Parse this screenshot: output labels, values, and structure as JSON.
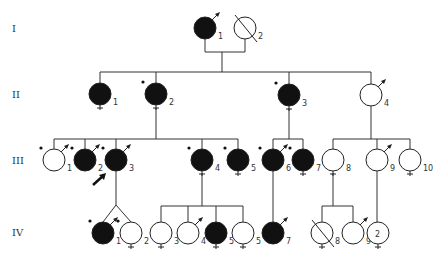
{
  "generations": [
    {
      "label": "I",
      "y": 28
    },
    {
      "label": "II",
      "y": 94
    },
    {
      "label": "III",
      "y": 160
    },
    {
      "label": "IV",
      "y": 232
    }
  ],
  "individuals": [
    {
      "id": "I-1",
      "num": "1",
      "x": 205,
      "y": 28,
      "affected": true,
      "examined": false,
      "arrow": true,
      "deceased": false,
      "cross": false
    },
    {
      "id": "I-2",
      "num": "2",
      "x": 245,
      "y": 28,
      "affected": false,
      "examined": false,
      "arrow": false,
      "deceased": true,
      "cross": false
    },
    {
      "id": "II-1",
      "num": "1",
      "x": 100,
      "y": 94,
      "affected": true,
      "examined": false,
      "arrow": false,
      "deceased": false,
      "cross": true
    },
    {
      "id": "II-2",
      "num": "2",
      "x": 156,
      "y": 94,
      "affected": true,
      "examined": true,
      "arrow": false,
      "deceased": false,
      "cross": true
    },
    {
      "id": "II-3",
      "num": "3",
      "x": 289,
      "y": 95,
      "affected": true,
      "examined": true,
      "arrow": false,
      "deceased": false,
      "cross": true
    },
    {
      "id": "II-4",
      "num": "4",
      "x": 371,
      "y": 95,
      "affected": false,
      "examined": false,
      "arrow": true,
      "deceased": false,
      "cross": false
    },
    {
      "id": "III-1",
      "num": "1",
      "x": 54,
      "y": 160,
      "affected": false,
      "examined": true,
      "arrow": true,
      "deceased": false,
      "cross": false
    },
    {
      "id": "III-2",
      "num": "2",
      "x": 85,
      "y": 160,
      "affected": true,
      "examined": true,
      "arrow": true,
      "deceased": false,
      "cross": false
    },
    {
      "id": "III-3",
      "num": "3",
      "x": 116,
      "y": 160,
      "affected": true,
      "examined": true,
      "arrow": true,
      "deceased": false,
      "cross": false,
      "proband": true
    },
    {
      "id": "III-4",
      "num": "4",
      "x": 202,
      "y": 160,
      "affected": true,
      "examined": true,
      "arrow": false,
      "deceased": false,
      "cross": true
    },
    {
      "id": "III-5",
      "num": "5",
      "x": 238,
      "y": 160,
      "affected": true,
      "examined": true,
      "arrow": false,
      "deceased": false,
      "cross": true
    },
    {
      "id": "III-6",
      "num": "6",
      "x": 273,
      "y": 160,
      "affected": true,
      "examined": true,
      "arrow": true,
      "deceased": false,
      "cross": false
    },
    {
      "id": "III-7",
      "num": "7",
      "x": 303,
      "y": 160,
      "affected": true,
      "examined": true,
      "arrow": false,
      "deceased": false,
      "cross": true
    },
    {
      "id": "III-8",
      "num": "8",
      "x": 333,
      "y": 160,
      "affected": false,
      "examined": false,
      "arrow": false,
      "deceased": false,
      "cross": true
    },
    {
      "id": "III-9",
      "num": "9",
      "x": 377,
      "y": 160,
      "affected": false,
      "examined": false,
      "arrow": true,
      "deceased": false,
      "cross": false
    },
    {
      "id": "III-10",
      "num": "10",
      "x": 410,
      "y": 160,
      "affected": false,
      "examined": false,
      "arrow": false,
      "deceased": false,
      "cross": true
    },
    {
      "id": "IV-1",
      "num": "1",
      "x": 103,
      "y": 233,
      "affected": true,
      "examined": true,
      "arrow": true,
      "deceased": false,
      "cross": false
    },
    {
      "id": "IV-2",
      "num": "2",
      "x": 131,
      "y": 233,
      "affected": false,
      "examined": true,
      "arrow": false,
      "deceased": false,
      "cross": true
    },
    {
      "id": "IV-3",
      "num": "3",
      "x": 161,
      "y": 233,
      "affected": false,
      "examined": false,
      "arrow": false,
      "deceased": false,
      "cross": true
    },
    {
      "id": "IV-4",
      "num": "4",
      "x": 188,
      "y": 233,
      "affected": false,
      "examined": false,
      "arrow": true,
      "deceased": false,
      "cross": false
    },
    {
      "id": "IV-5",
      "num": "5",
      "x": 216,
      "y": 233,
      "affected": true,
      "examined": false,
      "arrow": false,
      "deceased": false,
      "cross": true
    },
    {
      "id": "IV-6",
      "num": "5",
      "x": 243,
      "y": 233,
      "affected": false,
      "examined": false,
      "arrow": false,
      "deceased": false,
      "cross": true
    },
    {
      "id": "IV-7",
      "num": "7",
      "x": 273,
      "y": 233,
      "affected": true,
      "examined": false,
      "arrow": true,
      "deceased": false,
      "cross": false
    },
    {
      "id": "IV-8",
      "num": "8",
      "x": 322,
      "y": 233,
      "affected": false,
      "examined": false,
      "arrow": false,
      "deceased": true,
      "cross": true
    },
    {
      "id": "IV-9",
      "num": "9",
      "x": 353,
      "y": 233,
      "affected": false,
      "examined": false,
      "arrow": true,
      "deceased": false,
      "cross": false
    },
    {
      "id": "IV-10",
      "num": "",
      "inner": "2",
      "x": 378,
      "y": 233,
      "affected": false,
      "examined": false,
      "arrow": false,
      "deceased": false,
      "cross": true
    }
  ],
  "lines": [
    [
      205,
      39,
      205,
      52
    ],
    [
      245,
      39,
      245,
      52
    ],
    [
      205,
      52,
      245,
      52
    ],
    [
      222,
      52,
      222,
      72
    ],
    [
      100,
      72,
      371,
      72
    ],
    [
      100,
      72,
      100,
      83
    ],
    [
      156,
      72,
      156,
      83
    ],
    [
      289,
      72,
      289,
      84
    ],
    [
      371,
      72,
      371,
      84
    ],
    [
      156,
      108,
      156,
      139
    ],
    [
      54,
      139,
      238,
      139
    ],
    [
      54,
      139,
      54,
      149
    ],
    [
      85,
      139,
      85,
      149
    ],
    [
      116,
      139,
      116,
      149
    ],
    [
      202,
      139,
      202,
      149
    ],
    [
      238,
      139,
      238,
      149
    ],
    [
      289,
      108,
      289,
      139
    ],
    [
      273,
      139,
      303,
      139
    ],
    [
      273,
      139,
      273,
      149
    ],
    [
      303,
      139,
      303,
      149
    ],
    [
      371,
      106,
      371,
      139
    ],
    [
      333,
      139,
      410,
      139
    ],
    [
      333,
      139,
      333,
      149
    ],
    [
      377,
      139,
      377,
      149
    ],
    [
      410,
      139,
      410,
      149
    ],
    [
      116,
      171,
      116,
      205
    ],
    [
      116,
      205,
      103,
      222
    ],
    [
      116,
      205,
      131,
      222
    ],
    [
      202,
      173,
      202,
      206
    ],
    [
      161,
      206,
      243,
      206
    ],
    [
      161,
      206,
      161,
      222
    ],
    [
      188,
      206,
      188,
      222
    ],
    [
      216,
      206,
      216,
      222
    ],
    [
      243,
      206,
      243,
      222
    ],
    [
      273,
      171,
      273,
      222
    ],
    [
      333,
      173,
      333,
      206
    ],
    [
      322,
      206,
      353,
      206
    ],
    [
      322,
      206,
      322,
      222
    ],
    [
      353,
      206,
      353,
      222
    ],
    [
      377,
      171,
      377,
      222
    ]
  ],
  "proband_arrow": {
    "x1": 93,
    "y1": 185,
    "x2": 106,
    "y2": 173
  }
}
